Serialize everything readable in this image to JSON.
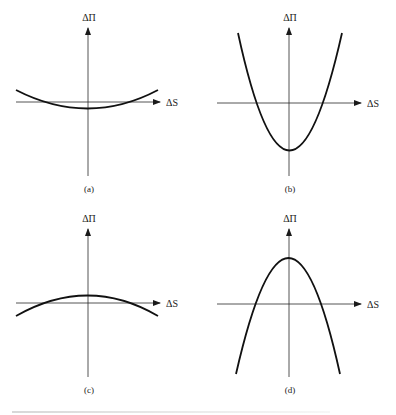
{
  "figure": {
    "y_axis_label": "ΔΠ",
    "x_axis_label": "ΔS",
    "panels": [
      {
        "id": "a",
        "caption": "(a)",
        "shape": "shallow upward-opening parabola, vertex slightly below x-axis"
      },
      {
        "id": "b",
        "caption": "(b)",
        "shape": "steep upward-opening parabola, vertex well below x-axis"
      },
      {
        "id": "c",
        "caption": "(c)",
        "shape": "shallow downward-opening parabola, vertex slightly above x-axis"
      },
      {
        "id": "d",
        "caption": "(d)",
        "shape": "steep downward-opening parabola, vertex well above x-axis"
      }
    ]
  },
  "colors": {
    "curve": "#111111",
    "axis": "#2a2a2a",
    "background": "#ffffff"
  }
}
